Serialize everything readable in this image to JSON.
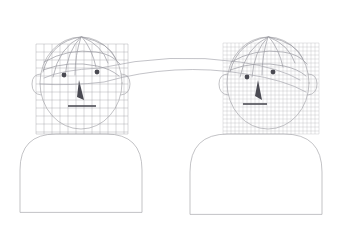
{
  "scene": {
    "title": "Face mesh correspondence illustration",
    "background_color": "#ffffff",
    "width": 345,
    "height": 225,
    "outline_color": "#a9a9ad",
    "mesh_color": "#9b9ba3",
    "feature_color": "#4a4a52",
    "link_color": "#9d9da5"
  },
  "figures": [
    {
      "id": "left-figure",
      "label": "Source face",
      "head": {
        "center_x": 81,
        "center_y": 83,
        "radius_x": 41,
        "radius_y": 46
      },
      "mesh": {
        "label": "Coarse mesh overlay",
        "x": 36,
        "y": 44,
        "width": 92,
        "height": 90,
        "cell_size": 8,
        "columns": 12,
        "rows": 12,
        "density": "coarse"
      },
      "features": {
        "left_eye": {
          "cx": 64,
          "cy": 75,
          "r": 2.4
        },
        "right_eye": {
          "cx": 97,
          "cy": 72,
          "r": 2.4
        },
        "nose": {
          "x": 79,
          "y": 80,
          "height": 20,
          "width": 7
        },
        "mouth": {
          "x1": 68,
          "y1": 106,
          "x2": 96,
          "y2": 106
        }
      },
      "body": {
        "label": "Shoulders and torso",
        "x": 20,
        "y": 134,
        "width": 122,
        "height": 78,
        "corner_radius": 36
      }
    },
    {
      "id": "right-figure",
      "label": "Target face",
      "head": {
        "center_x": 268,
        "center_y": 83,
        "radius_x": 41,
        "radius_y": 46
      },
      "mesh": {
        "label": "Fine mesh overlay",
        "x": 223,
        "y": 43,
        "width": 96,
        "height": 91,
        "cell_size": 4,
        "columns": 24,
        "rows": 23,
        "density": "fine"
      },
      "features": {
        "left_eye": {
          "cx": 247,
          "cy": 77,
          "r": 2.4
        },
        "right_eye": {
          "cx": 273,
          "cy": 72,
          "r": 2.4
        },
        "nose": {
          "x": 258,
          "y": 80,
          "height": 20,
          "width": 7
        },
        "mouth": {
          "x1": 243,
          "y1": 104,
          "x2": 267,
          "y2": 104
        }
      },
      "body": {
        "label": "Shoulders and torso",
        "x": 190,
        "y": 134,
        "width": 132,
        "height": 80,
        "corner_radius": 38
      }
    }
  ],
  "connectors": [
    {
      "id": "correspondence-arc-upper",
      "label": "Upper correspondence arc",
      "from": "left-figure-eye",
      "to": "right-figure-eye"
    },
    {
      "id": "correspondence-arc-lower",
      "label": "Lower correspondence arc",
      "from": "left-figure-nose",
      "to": "right-figure-nose"
    }
  ]
}
